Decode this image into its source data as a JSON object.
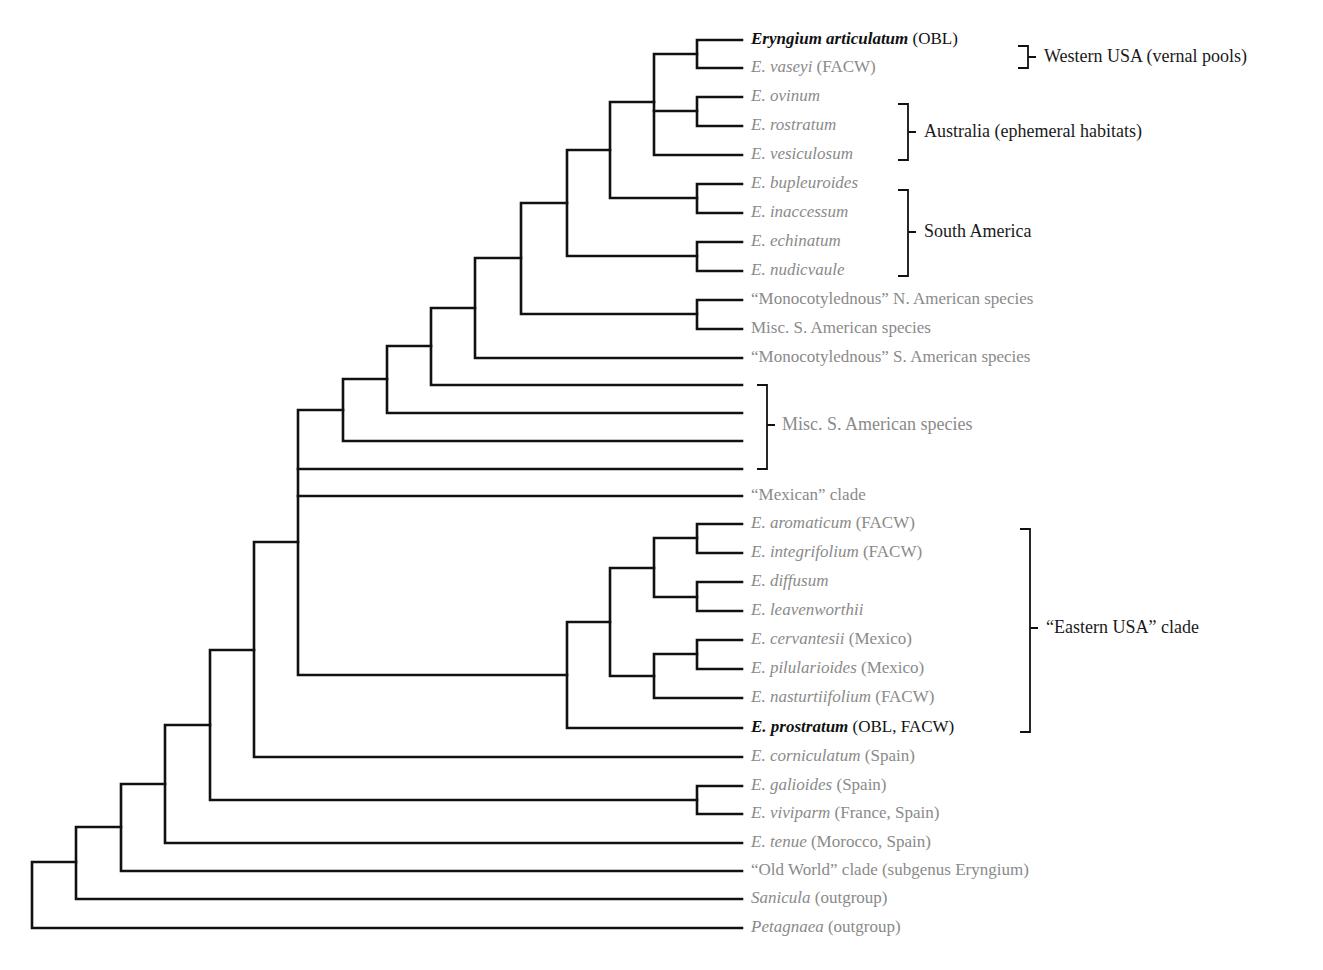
{
  "colors": {
    "branch": "#111111",
    "leaf_text_grey": "#8a8a8a",
    "leaf_text_dark": "#111111",
    "group_text": "#1a1a1a"
  },
  "leaves": [
    {
      "species": "Eryngium articulatum",
      "note": " (OBL)",
      "emphasis": true
    },
    {
      "species": "E. vaseyi",
      "note": " (FACW)"
    },
    {
      "species": "E. ovinum",
      "note": ""
    },
    {
      "species": "E. rostratum",
      "note": ""
    },
    {
      "species": "E. vesiculosum",
      "note": ""
    },
    {
      "species": "E. bupleuroides",
      "note": ""
    },
    {
      "species": "E. inaccessum",
      "note": ""
    },
    {
      "species": "E. echinatum",
      "note": ""
    },
    {
      "species": "E. nudicvaule",
      "note": ""
    },
    {
      "species": "",
      "note": "“Monocotylednous” N. American species"
    },
    {
      "species": "",
      "note": "Misc. S. American species"
    },
    {
      "species": "",
      "note": "“Monocotylednous” S. American species"
    },
    {
      "species": "",
      "note": ""
    },
    {
      "species": "",
      "note": ""
    },
    {
      "species": "",
      "note": ""
    },
    {
      "species": "",
      "note": ""
    },
    {
      "species": "",
      "note": "“Mexican” clade"
    },
    {
      "species": "E. aromaticum",
      "note": " (FACW)"
    },
    {
      "species": "E. integrifolium",
      "note": " (FACW)"
    },
    {
      "species": "E. diffusum",
      "note": ""
    },
    {
      "species": "E. leavenworthii",
      "note": ""
    },
    {
      "species": "E. cervantesii",
      "note": " (Mexico)"
    },
    {
      "species": "E. pilularioides",
      "note": " (Mexico)"
    },
    {
      "species": "E. nasturtiifolium",
      "note": " (FACW)"
    },
    {
      "species": "E. prostratum",
      "note": " (OBL, FACW)",
      "emphasis": true
    },
    {
      "species": "E. corniculatum",
      "note": " (Spain)"
    },
    {
      "species": "E. galioides",
      "note": " (Spain)"
    },
    {
      "species": "E. viviparm",
      "note": " (France, Spain)"
    },
    {
      "species": "E. tenue",
      "note": " (Morocco, Spain)"
    },
    {
      "species": "",
      "note": "“Old World” clade (subgenus Eryngium)"
    },
    {
      "species": "Sanicula",
      "note": " (outgroup)"
    },
    {
      "species": "Petagnaea",
      "note": " (outgroup)"
    }
  ],
  "groups": [
    {
      "label": "Western USA (vernal pools)"
    },
    {
      "label": "Australia (ephemeral habitats)"
    },
    {
      "label": "South America"
    },
    {
      "label": "Misc. S. American species"
    },
    {
      "label": "“Eastern USA” clade"
    }
  ]
}
